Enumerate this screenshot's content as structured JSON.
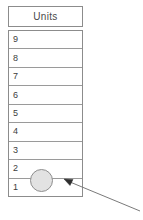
{
  "diagram": {
    "title_cell": {
      "label": "Units"
    },
    "column": {
      "name": "units-stack",
      "rows": [
        {
          "label": "9"
        },
        {
          "label": "8"
        },
        {
          "label": "7"
        },
        {
          "label": "6"
        },
        {
          "label": "5"
        },
        {
          "label": "4"
        },
        {
          "label": "3"
        },
        {
          "label": "2"
        },
        {
          "label": "1"
        }
      ]
    },
    "marker": {
      "name": "counter-token",
      "fill_color": "#e2e2e2",
      "stroke_color": "#8e8e8e"
    },
    "annotation": {
      "name": "pointer-arrow",
      "stroke_color": "#7a7a7a"
    },
    "colors": {
      "background": "#ffffff",
      "border": "#8c8c8c",
      "grid_line": "#9a9a9a",
      "text": "#3d3d3d",
      "header_text": "#4a4a4a"
    }
  }
}
